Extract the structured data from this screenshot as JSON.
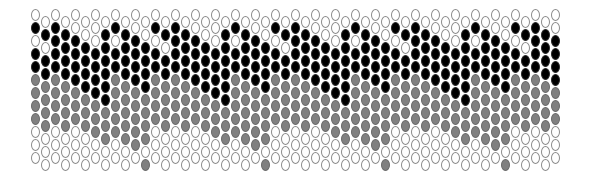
{
  "pattern": {
    "type": "peyote-bead-chart",
    "origin_x": 31,
    "origin_y": 9,
    "column_pitch": 10,
    "row_pitch": 13,
    "odd_column_offset_y": 7,
    "rows_per_column": 12,
    "column_count": 53,
    "colors": {
      "W": "#ffffff",
      "B": "#000000",
      "G": "#808080"
    },
    "motif_columns": [
      "WBWBBGGGGWWW",
      "WBWBBGGGGWWW",
      "WBBBBGGGGWWW",
      "WBBBBGGGGWWW",
      "WWBBBBGGGWWW",
      "WWBBBBGGGWWW",
      "WWWBBBBGGGWW",
      "WBBBBBBGGGWW",
      "WBWBBGGGGGWW",
      "WBBBBGGGGGWW",
      "WWBBBBGGGGGW",
      "WWBBBBGGGGWG"
    ]
  }
}
